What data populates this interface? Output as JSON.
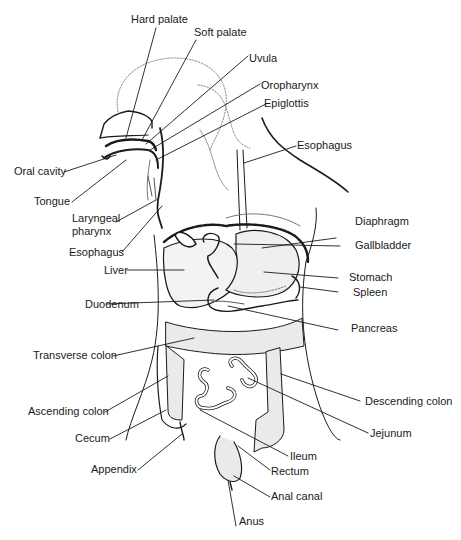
{
  "diagram": {
    "colors": {
      "ink": "#1a1a1a",
      "dotted": "#8a8a8a",
      "shade": "#d9d9d9"
    },
    "labels": {
      "hard_palate": "Hard palate",
      "soft_palate": "Soft palate",
      "uvula": "Uvula",
      "oropharynx": "Oropharynx",
      "epiglottis": "Epiglottis",
      "esophagus_upper": "Esophagus",
      "oral_cavity": "Oral cavity",
      "tongue": "Tongue",
      "laryngeal_pharynx_1": "Laryngeal",
      "laryngeal_pharynx_2": "pharynx",
      "esophagus_lower": "Esophagus",
      "diaphragm": "Diaphragm",
      "gallbladder": "Gallbladder",
      "liver": "Liver",
      "stomach": "Stomach",
      "spleen": "Spleen",
      "duodenum": "Duodenum",
      "pancreas": "Pancreas",
      "transverse_colon": "Transverse colon",
      "descending_colon": "Descending colon",
      "ascending_colon": "Ascending colon",
      "jejunum": "Jejunum",
      "cecum": "Cecum",
      "ileum": "Ileum",
      "appendix": "Appendix",
      "rectum": "Rectum",
      "anal_canal": "Anal canal",
      "anus": "Anus"
    }
  }
}
